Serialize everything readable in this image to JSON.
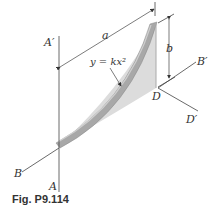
{
  "figure": {
    "caption": "Fig. P9.114",
    "equation": "y = kx²",
    "dimensions": {
      "horizontal": "a",
      "vertical": "b"
    },
    "points": {
      "A": "A",
      "A_prime": "A′",
      "B": "B",
      "B_prime": "B′",
      "D": "D",
      "D_prime": "D′"
    },
    "colors": {
      "line": "#444444",
      "fill": "#d8d8d8",
      "strip": "#b0b0b0"
    }
  }
}
